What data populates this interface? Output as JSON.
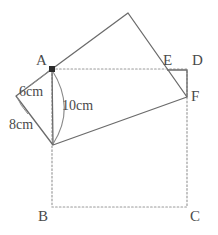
{
  "figure": {
    "canvas": {
      "width": 218,
      "height": 235
    },
    "colors": {
      "stroke_solid": "#6b6b6b",
      "stroke_dotted": "#9a9a9a",
      "text": "#4a4a4a",
      "vertex_dot": "#2b2b2b",
      "background": "#ffffff"
    },
    "vertex_labels": [
      {
        "name": "A",
        "text": "A",
        "x": 36,
        "y": 53
      },
      {
        "name": "B",
        "text": "B",
        "x": 38,
        "y": 209
      },
      {
        "name": "C",
        "text": "C",
        "x": 190,
        "y": 209
      },
      {
        "name": "D",
        "text": "D",
        "x": 192,
        "y": 53
      },
      {
        "name": "E",
        "text": "E",
        "x": 163,
        "y": 53
      },
      {
        "name": "F",
        "text": "F",
        "x": 191,
        "y": 89
      }
    ],
    "measure_labels": [
      {
        "name": "6cm",
        "text": "6cm",
        "x": 19,
        "y": 85
      },
      {
        "name": "8cm",
        "text": "8cm",
        "x": 9,
        "y": 118
      },
      {
        "name": "10cm",
        "text": "10cm",
        "x": 62,
        "y": 99
      }
    ],
    "points": {
      "A": {
        "x": 52,
        "y": 69
      },
      "B": {
        "x": 52,
        "y": 207
      },
      "C": {
        "x": 187,
        "y": 207
      },
      "D": {
        "x": 187,
        "y": 69
      },
      "E": {
        "x": 167,
        "y": 70
      },
      "F": {
        "x": 187,
        "y": 97
      },
      "apex": {
        "x": 128,
        "y": 13
      },
      "lower": {
        "x": 53,
        "y": 145
      },
      "left": {
        "x": 16,
        "y": 96
      }
    },
    "paths": {
      "outer_rect_dotted": "M 52 69 L 187 69 L 187 207 L 52 207 Z",
      "rotated_rect_solid": "M 52 69 L 128 13 L 187 97 L 53 145 Z",
      "triangle_left_solid": "M 52 69 L 16 96 L 53 145",
      "corner_ed_solid": "M 167 70 L 187 70 L 187 97",
      "arc_10cm": "M 52 70 Q 76 108 53 144",
      "leader_6cm": "M 30 84 Q 41 76 50 70",
      "leader_8cm": "M 27 113 Q 20 104 17 97"
    }
  }
}
